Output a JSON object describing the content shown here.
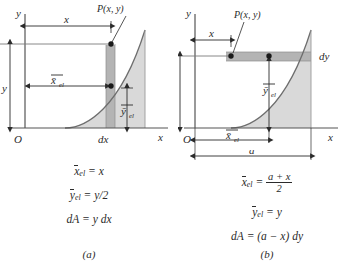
{
  "figure": {
    "caption_a": "(a)",
    "caption_b": "(b)",
    "colors": {
      "ink": "#2b2b2b",
      "area_fill": "#d9d9d9",
      "strip_fill": "#b4b4b4",
      "curve": "#6e6e6e",
      "axis": "#555555"
    }
  },
  "panel_a": {
    "axis_y_label": "y",
    "axis_x_label": "x",
    "origin_label": "O",
    "point_label": "P(x, y)",
    "dim_x": "x",
    "dim_y": "y",
    "dim_xel": "x̄",
    "dim_xel_sub": "el",
    "dim_yel": "ȳ",
    "dim_yel_sub": "el",
    "strip_label": "dx",
    "equations": [
      {
        "lhs_bar": "x",
        "lhs_sub": "el",
        "rhs": "x"
      },
      {
        "lhs_bar": "y",
        "lhs_sub": "el",
        "rhs": "y/2"
      },
      {
        "lhs_plain": "dA",
        "rhs": "y dx"
      }
    ],
    "eq1_text": "= x",
    "eq2_text": "= y/2",
    "eq3_lhs": "dA",
    "eq3_text": "= y dx"
  },
  "panel_b": {
    "axis_y_label": "y",
    "axis_x_label": "x",
    "origin_label": "O",
    "point_label": "P(x, y)",
    "dim_x": "x",
    "dim_y": "y",
    "dim_xel": "x̄",
    "dim_xel_sub": "el",
    "dim_yel": "ȳ",
    "dim_yel_sub": "el",
    "dim_a": "a",
    "strip_label": "dy",
    "eq1_num": "a + x",
    "eq1_den": "2",
    "eq2_text": "= y",
    "eq3_lhs": "dA",
    "eq3_text": "= (a − x) dy"
  }
}
